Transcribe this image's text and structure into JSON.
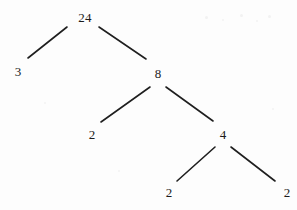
{
  "diagram": {
    "kind": "factor-tree",
    "background_color": "#fdfdfd",
    "stroke_color": "#1f1f1f",
    "text_color": "#1b1b1b",
    "nodes": [
      {
        "id": "root",
        "label": "24",
        "x": 85,
        "y": 17
      },
      {
        "id": "n3",
        "label": "3",
        "x": 18,
        "y": 71
      },
      {
        "id": "n8",
        "label": "8",
        "x": 158,
        "y": 73
      },
      {
        "id": "n2a",
        "label": "2",
        "x": 92,
        "y": 134
      },
      {
        "id": "n4",
        "label": "4",
        "x": 223,
        "y": 134
      },
      {
        "id": "n2b",
        "label": "2",
        "x": 169,
        "y": 192
      },
      {
        "id": "n2c",
        "label": "2",
        "x": 287,
        "y": 192
      }
    ],
    "edges": [
      {
        "id": "e-root-3",
        "from": "root",
        "to": "n3",
        "x1": 67,
        "y1": 27,
        "x2": 28,
        "y2": 58
      },
      {
        "id": "e-root-8",
        "from": "root",
        "to": "n8",
        "x1": 99,
        "y1": 27,
        "x2": 146,
        "y2": 59
      },
      {
        "id": "e-8-2a",
        "from": "n8",
        "to": "n2a",
        "x1": 150,
        "y1": 87,
        "x2": 101,
        "y2": 122
      },
      {
        "id": "e-8-4",
        "from": "n8",
        "to": "n4",
        "x1": 166,
        "y1": 87,
        "x2": 213,
        "y2": 121
      },
      {
        "id": "e-4-2b",
        "from": "n4",
        "to": "n2b",
        "x1": 215,
        "y1": 147,
        "x2": 177,
        "y2": 181
      },
      {
        "id": "e-4-2c",
        "from": "n4",
        "to": "n2c",
        "x1": 231,
        "y1": 147,
        "x2": 275,
        "y2": 181
      }
    ],
    "specks": [
      {
        "x": 205,
        "y": 16,
        "size": 3
      },
      {
        "x": 222,
        "y": 19,
        "size": 2
      },
      {
        "x": 240,
        "y": 14,
        "size": 3
      },
      {
        "x": 256,
        "y": 20,
        "size": 2
      },
      {
        "x": 268,
        "y": 15,
        "size": 3
      },
      {
        "x": 44,
        "y": 102,
        "size": 2
      },
      {
        "x": 272,
        "y": 108,
        "size": 2
      },
      {
        "x": 118,
        "y": 170,
        "size": 2
      }
    ]
  }
}
